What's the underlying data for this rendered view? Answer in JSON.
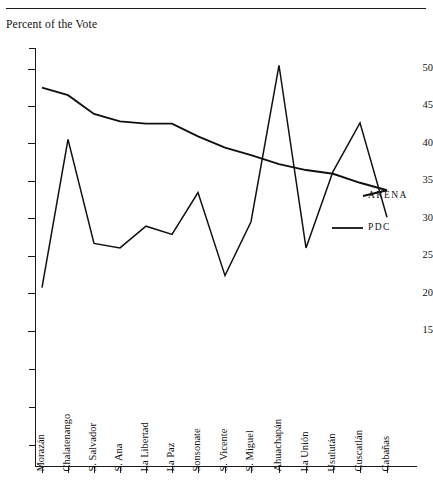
{
  "figure": {
    "y_axis_caption": "Percent of the Vote"
  },
  "series_labels": {
    "arena": "ARENA",
    "pdc": "PDC"
  },
  "chart_data": {
    "type": "line",
    "title": "",
    "subtitle": "",
    "xlabel": "",
    "ylabel": "Percent of the Vote",
    "ylim": [
      11,
      52
    ],
    "yticks": [
      15,
      20,
      25,
      30,
      35,
      40,
      45,
      50
    ],
    "ytick_labels": [
      "15",
      "20",
      "25",
      "30",
      "35",
      "40",
      "45",
      "50"
    ],
    "grid": false,
    "legend_position": "right-inline",
    "categories": [
      "Morazán",
      "Chalatenango",
      "S. Salvador",
      "S. Ana",
      "La Libertad",
      "La Paz",
      "Sonsonate",
      "S. Vicente",
      "S. Miguel",
      "Ahuachapán",
      "La Unión",
      "Usulután",
      "Cuscatlán",
      "Cabañas"
    ],
    "series": [
      {
        "name": "ARENA",
        "color": "#101010",
        "values": [
          47.5,
          46.5,
          44.0,
          43.0,
          42.7,
          42.7,
          41.0,
          39.5,
          38.5,
          37.3,
          36.5,
          36.0,
          34.8,
          33.8
        ]
      },
      {
        "name": "PDC",
        "color": "#101010",
        "values": [
          20.8,
          40.6,
          26.7,
          26.1,
          29.0,
          27.9,
          33.5,
          22.4,
          29.6,
          50.5,
          26.1,
          36.3,
          42.8,
          30.2
        ]
      }
    ]
  },
  "geometry": {
    "plot": {
      "left": 35,
      "right": 417,
      "top": 48,
      "bottom": 466
    },
    "y_ref": {
      "value_a": 50,
      "px_a": 69,
      "value_b": 15,
      "px_b": 331
    },
    "x_positions": [
      42,
      68,
      94,
      120,
      146,
      172,
      198,
      225,
      251,
      279,
      306,
      333,
      360,
      387
    ],
    "y_minor_ticks_px": [
      48,
      369,
      407,
      445
    ],
    "series_label_px": {
      "arena": {
        "x": 368,
        "y": 196
      },
      "pdc": {
        "x": 368,
        "y": 228
      }
    },
    "pdc_label_leader": {
      "x1": 332,
      "y1": 228,
      "x2": 363,
      "y2": 228
    },
    "arena_label_leader": {
      "x1": 346,
      "y1": 186,
      "x2": 363,
      "y2": 196
    },
    "xlabel_baseline_y": 461
  }
}
